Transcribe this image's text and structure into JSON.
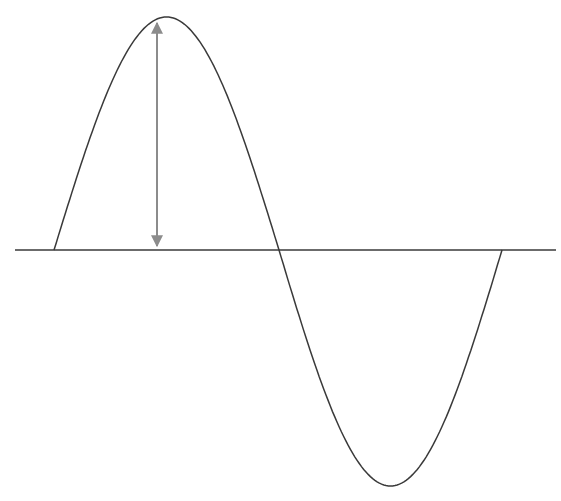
{
  "diagram": {
    "title": "",
    "colors": {
      "wave": "#3a3a3a",
      "axis": "#3a3a3a",
      "arrow": "#8c8c8c",
      "background": "#ffffff"
    },
    "axis": {
      "x1": 15,
      "x2": 556,
      "y": 250
    },
    "wave": {
      "start_x": 54,
      "end_x": 502,
      "zero_cross_x": 279,
      "peak": {
        "x": 157,
        "y": 17
      },
      "trough": {
        "x": 400,
        "y": 486
      }
    },
    "amplitude_arrow": {
      "x": 157,
      "y_top": 19,
      "y_bottom": 250,
      "label": ""
    }
  }
}
